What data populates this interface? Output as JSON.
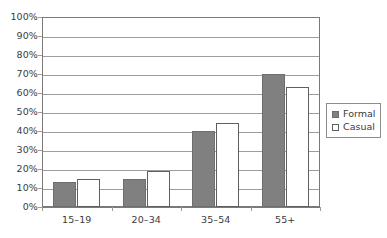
{
  "chart_data": {
    "type": "bar",
    "title": "",
    "subtitle": "",
    "xlabel": "",
    "ylabel": "",
    "categories": [
      "15–19",
      "20–34",
      "35–54",
      "55+"
    ],
    "series": [
      {
        "name": "Formal",
        "values": [
          13,
          15,
          40,
          70
        ],
        "color": "#808080",
        "fill": "solid"
      },
      {
        "name": "Casual",
        "values": [
          15,
          19,
          44,
          63
        ],
        "color": "#ffffff",
        "fill": "outline"
      }
    ],
    "ylim": [
      0,
      100
    ],
    "ytick_values": [
      0,
      10,
      20,
      30,
      40,
      50,
      60,
      70,
      80,
      90,
      100
    ],
    "ytick_labels": [
      "0%",
      "10%",
      "20%",
      "30%",
      "40%",
      "50%",
      "60%",
      "70%",
      "80%",
      "90%",
      "100%"
    ],
    "value_suffix": "%",
    "grid": true,
    "grid_axis": "y",
    "legend_position": "right",
    "legend_entries": [
      "Formal",
      "Casual"
    ],
    "plot_border": true,
    "axis_color": "#7a7a7a",
    "grid_color": "#9d9d9d",
    "text_color": "#3b3b3b",
    "background": "#ffffff"
  }
}
